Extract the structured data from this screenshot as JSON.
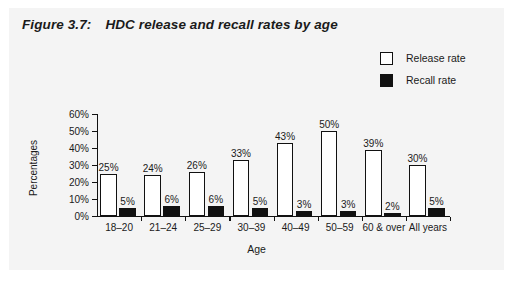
{
  "figure": {
    "number": "Figure 3.7:",
    "title": "HDC release and recall rates by age"
  },
  "legend": {
    "position": "top-right",
    "items": [
      {
        "label": "Release rate",
        "swatch": "white-square-black-border",
        "color": "#ffffff"
      },
      {
        "label": "Recall rate",
        "swatch": "black-square",
        "color": "#111111"
      }
    ]
  },
  "chart_data": {
    "type": "bar",
    "title": "HDC release and recall rates by age",
    "xlabel": "Age",
    "ylabel": "Percentages",
    "ylim": [
      0,
      60
    ],
    "yticks": [
      "0%",
      "10%",
      "20%",
      "30%",
      "40%",
      "50%",
      "60%"
    ],
    "ytick_values": [
      0,
      10,
      20,
      30,
      40,
      50,
      60
    ],
    "grid": false,
    "legend_position": "top-right",
    "categories": [
      "18–20",
      "21–24",
      "25–29",
      "30–39",
      "40–49",
      "50–59",
      "60 & over",
      "All years"
    ],
    "series": [
      {
        "name": "Release rate",
        "color": "#ffffff",
        "values": [
          25,
          24,
          26,
          33,
          43,
          50,
          39,
          30
        ],
        "labels": [
          "25%",
          "24%",
          "26%",
          "33%",
          "43%",
          "50%",
          "39%",
          "30%"
        ]
      },
      {
        "name": "Recall rate",
        "color": "#111111",
        "values": [
          5,
          6,
          6,
          5,
          3,
          3,
          2,
          5
        ],
        "labels": [
          "5%",
          "6%",
          "6%",
          "5%",
          "3%",
          "3%",
          "2%",
          "5%"
        ]
      }
    ]
  }
}
